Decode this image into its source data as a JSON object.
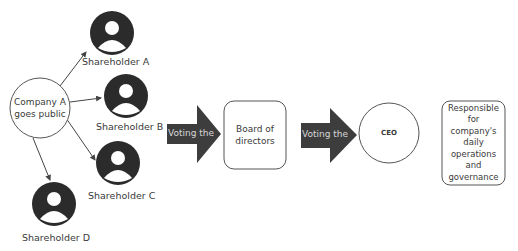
{
  "diagram": {
    "company_node": {
      "label_line1": "Company A",
      "label_line2": "goes public"
    },
    "shareholders": [
      {
        "label": "Shareholder A"
      },
      {
        "label": "Shareholder B"
      },
      {
        "label": "Shareholder C"
      },
      {
        "label": "Shareholder D"
      }
    ],
    "arrows": [
      {
        "label": "Voting the"
      },
      {
        "label": "Voting the"
      }
    ],
    "board_node": {
      "label_line1": "Board of",
      "label_line2": "directors"
    },
    "ceo_node": {
      "label": "CEO"
    },
    "responsibility_node": {
      "lines": [
        "Responsible",
        "for",
        "company's",
        "daily",
        "operations",
        "and",
        "governance"
      ]
    },
    "colors": {
      "icon_fill": "#2b2b2b",
      "arrow_fill": "#3d3d3d",
      "stroke": "#444444",
      "text": "#3a3a3a"
    }
  }
}
